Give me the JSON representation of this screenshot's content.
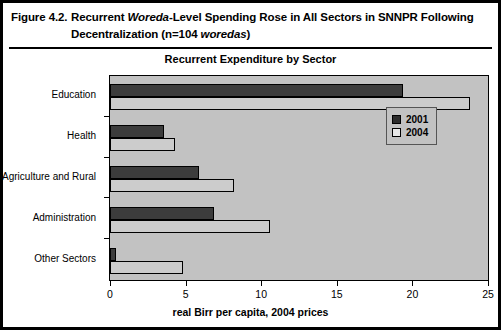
{
  "figure": {
    "label": "Figure 4.2.",
    "caption_line1_pre": "Recurrent ",
    "caption_line1_italic": "Woreda",
    "caption_line1_post": "-Level Spending Rose in All Sectors in SNNPR Following",
    "caption_line2_pre": "Decentralization (n=104 ",
    "caption_line2_italic": "woredas",
    "caption_line2_post": ")"
  },
  "chart_data": {
    "type": "bar",
    "orientation": "horizontal",
    "title": "Recurrent Expenditure by Sector",
    "xlabel": "real Birr per capita, 2004 prices",
    "ylabel": "",
    "categories": [
      "Education",
      "Health",
      "Agriculture and Rural",
      "Administration",
      "Other Sectors"
    ],
    "series": [
      {
        "name": "2001",
        "color": "#3c3c3c",
        "values": [
          19.4,
          3.6,
          5.9,
          6.9,
          0.4
        ]
      },
      {
        "name": "2004",
        "color": "#cccccc",
        "values": [
          23.8,
          4.3,
          8.2,
          10.6,
          4.8
        ]
      }
    ],
    "xlim": [
      0,
      25
    ],
    "xticks": [
      0,
      5,
      10,
      15,
      20,
      25
    ],
    "xtick_labels": [
      "0",
      "5",
      "10",
      "15",
      "20",
      "25"
    ],
    "grid": false,
    "legend_position": "upper right",
    "plot_background": "#c2c2c2"
  }
}
